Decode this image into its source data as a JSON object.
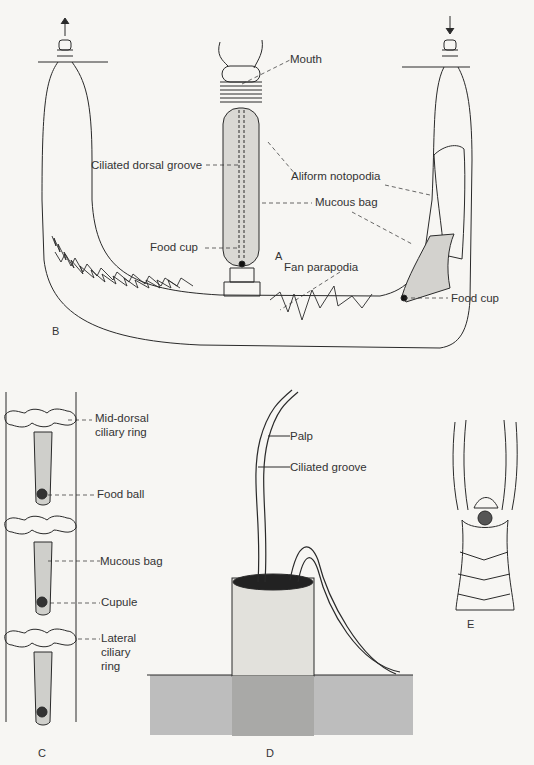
{
  "figure": {
    "panels": {
      "A": "A",
      "B": "B",
      "C": "C",
      "D": "D",
      "E": "E"
    },
    "labels_AB": {
      "mouth": "Mouth",
      "ciliated_dorsal_groove": "Ciliated dorsal groove",
      "aliform_notopodia": "Aliform notopodia",
      "mucous_bag": "Mucous bag",
      "food_cup_a": "Food cup",
      "fan_parapodia": "Fan parapodia",
      "food_cup_b": "Food cup"
    },
    "labels_C": {
      "mid_dorsal_1": "Mid-dorsal",
      "mid_dorsal_2": "ciliary ring",
      "food_ball": "Food ball",
      "mucous_bag": "Mucous bag",
      "cupule": "Cupule",
      "lateral_1": "Lateral",
      "lateral_2": "ciliary",
      "lateral_3": "ring"
    },
    "labels_D": {
      "palp": "Palp",
      "ciliated_groove": "Ciliated groove"
    },
    "colors": {
      "ink": "#2a2a2a",
      "paper": "#f7f6f3",
      "stipple": "#8a8a8a",
      "sediment": "#bdbdbd"
    }
  }
}
